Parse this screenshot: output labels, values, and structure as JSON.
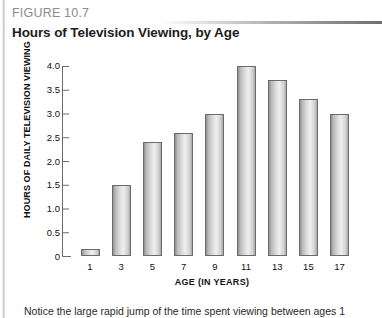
{
  "figure": {
    "number_label": "FIGURE 10.7",
    "title": "Hours of Television Viewing, by Age"
  },
  "caption": {
    "text": "Notice the large rapid jump of the time spent viewing between ages 1 and 3"
  },
  "colors": {
    "figure_number": "#8c8c8c",
    "title": "#1c1c1c",
    "axis": "#6b6b6b",
    "bar_outline": "#6b6b6b",
    "bar_fill_light": "#efefef",
    "bar_fill_dark": "#8f8f8f",
    "rule_gradient_end": "#6e6e6e"
  },
  "chart_data": {
    "type": "bar",
    "title": "Hours of Television Viewing, by Age",
    "xlabel": "AGE (IN YEARS)",
    "ylabel": "HOURS OF DAILY TELEVISION VIEWING",
    "categories": [
      "1",
      "3",
      "5",
      "7",
      "9",
      "11",
      "13",
      "15",
      "17"
    ],
    "values": [
      0.15,
      1.5,
      2.4,
      2.6,
      3.0,
      4.0,
      3.7,
      3.3,
      3.0
    ],
    "ylim": [
      0,
      4.0
    ],
    "ytick_labels": [
      "4.0",
      "3.5",
      "3.0",
      "2.5",
      "2.0",
      "1.5",
      "1.0",
      "0.5",
      "0"
    ],
    "ytick_values": [
      4.0,
      3.5,
      3.0,
      2.5,
      2.0,
      1.5,
      1.0,
      0.5,
      0
    ],
    "grid": false,
    "legend": null
  }
}
